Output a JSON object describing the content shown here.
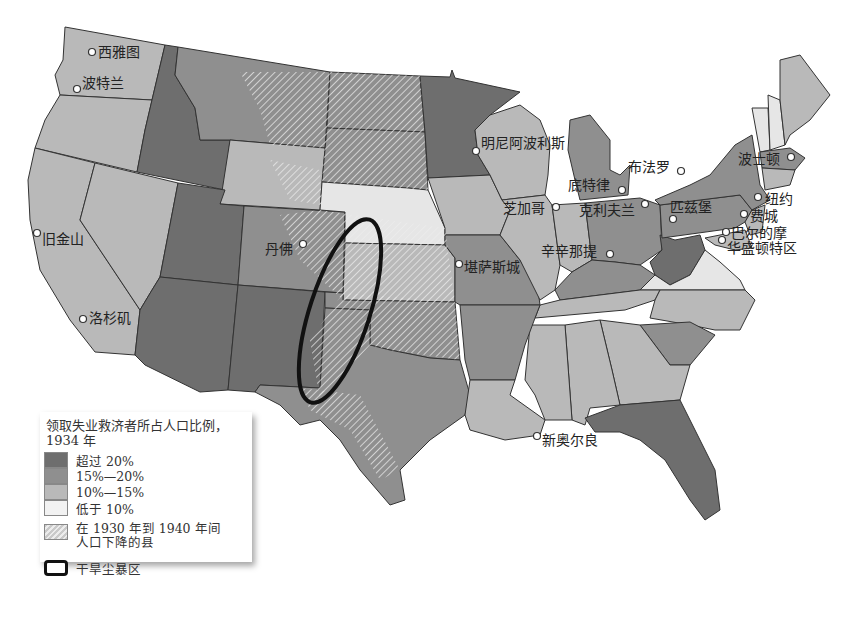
{
  "map": {
    "subject": "United States unemployment relief map",
    "year": "1934",
    "cities": [
      {
        "name": "西雅图",
        "x": 92,
        "y": 52
      },
      {
        "name": "波特兰",
        "x": 77,
        "y": 89
      },
      {
        "name": "旧金山",
        "x": 37,
        "y": 233
      },
      {
        "name": "洛杉矶",
        "x": 83,
        "y": 319
      },
      {
        "name": "丹佛",
        "x": 302,
        "y": 244
      },
      {
        "name": "明尼阿波利斯",
        "x": 476,
        "y": 150
      },
      {
        "name": "芝加哥",
        "x": 556,
        "y": 205
      },
      {
        "name": "底特律",
        "x": 622,
        "y": 190
      },
      {
        "name": "布法罗",
        "x": 680,
        "y": 171
      },
      {
        "name": "克利夫兰",
        "x": 645,
        "y": 203
      },
      {
        "name": "匹兹堡",
        "x": 673,
        "y": 218
      },
      {
        "name": "波士顿",
        "x": 791,
        "y": 157
      },
      {
        "name": "纽约",
        "x": 758,
        "y": 198
      },
      {
        "name": "费城",
        "x": 744,
        "y": 213
      },
      {
        "name": "巴尔的摩",
        "x": 726,
        "y": 232
      },
      {
        "name": "华盛顿特区",
        "x": 722,
        "y": 238
      },
      {
        "name": "辛辛那提",
        "x": 609,
        "y": 253
      },
      {
        "name": "堪萨斯城",
        "x": 459,
        "y": 265
      },
      {
        "name": "新奥尔良",
        "x": 537,
        "y": 436
      }
    ]
  },
  "legend": {
    "title": "领取失业救济者所占人口比例，",
    "title_year": "1934 年",
    "items": [
      {
        "label": "超过 20%",
        "color": "#6e6e6e"
      },
      {
        "label": "15%—20%",
        "color": "#8f8f8f"
      },
      {
        "label": "10%—15%",
        "color": "#b9b9b9"
      },
      {
        "label": "低于 10%",
        "color": "#e6e6e6"
      }
    ],
    "hatch_label_1": "在 1930 年到 1940 年间",
    "hatch_label_2": "人口下降的县",
    "dust_bowl_label": "干旱尘暴区"
  }
}
